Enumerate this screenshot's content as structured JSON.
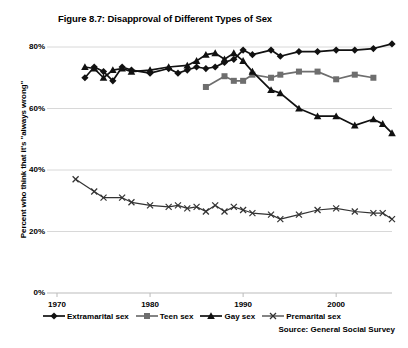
{
  "chart_data": {
    "type": "line",
    "title": "Figure 8.7: Disapproval of Different Types of Sex",
    "xlabel": "",
    "ylabel": "Percent who think that it's \"always wrong\"",
    "source": "Source: General Social Survey",
    "xlim": [
      1970,
      2006
    ],
    "ylim": [
      0,
      85
    ],
    "xticks": [
      1970,
      1980,
      1990,
      2000
    ],
    "xtick_labels": [
      "1970",
      "1980",
      "1990",
      "2000"
    ],
    "yticks": [
      0,
      20,
      40,
      60,
      80
    ],
    "ytick_labels": [
      "0%",
      "20%",
      "40%",
      "60%",
      "80%"
    ],
    "grid": "horizontal",
    "legend_position": "bottom",
    "series": [
      {
        "name": "Extramarital sex",
        "marker": "diamond",
        "color": "#111111",
        "points": [
          [
            1973,
            70.0
          ],
          [
            1974,
            73.5
          ],
          [
            1975,
            72.0
          ],
          [
            1976,
            69.0
          ],
          [
            1977,
            73.5
          ],
          [
            1978,
            72.5
          ],
          [
            1980,
            71.5
          ],
          [
            1982,
            73.0
          ],
          [
            1983,
            71.5
          ],
          [
            1984,
            72.5
          ],
          [
            1985,
            73.5
          ],
          [
            1986,
            73.0
          ],
          [
            1987,
            73.5
          ],
          [
            1988,
            75.0
          ],
          [
            1989,
            76.0
          ],
          [
            1990,
            79.0
          ],
          [
            1991,
            77.5
          ],
          [
            1993,
            79.0
          ],
          [
            1994,
            77.0
          ],
          [
            1996,
            78.5
          ],
          [
            1998,
            78.5
          ],
          [
            2000,
            79.0
          ],
          [
            2002,
            79.0
          ],
          [
            2004,
            79.5
          ],
          [
            2006,
            81.0
          ]
        ]
      },
      {
        "name": "Teen sex",
        "marker": "square",
        "color": "#6e6e6e",
        "points": [
          [
            1986,
            67.0
          ],
          [
            1988,
            70.5
          ],
          [
            1989,
            69.0
          ],
          [
            1990,
            69.0
          ],
          [
            1991,
            71.0
          ],
          [
            1993,
            70.0
          ],
          [
            1994,
            71.0
          ],
          [
            1996,
            72.0
          ],
          [
            1998,
            72.0
          ],
          [
            2000,
            69.5
          ],
          [
            2002,
            71.0
          ],
          [
            2004,
            70.0
          ]
        ]
      },
      {
        "name": "Gay sex",
        "marker": "triangle",
        "color": "#111111",
        "points": [
          [
            1973,
            73.5
          ],
          [
            1974,
            73.0
          ],
          [
            1975,
            70.0
          ],
          [
            1976,
            72.5
          ],
          [
            1977,
            73.0
          ],
          [
            1978,
            72.0
          ],
          [
            1980,
            72.5
          ],
          [
            1982,
            73.5
          ],
          [
            1984,
            74.0
          ],
          [
            1985,
            75.5
          ],
          [
            1986,
            77.5
          ],
          [
            1987,
            78.0
          ],
          [
            1988,
            76.0
          ],
          [
            1989,
            78.0
          ],
          [
            1990,
            75.5
          ],
          [
            1991,
            72.0
          ],
          [
            1993,
            66.0
          ],
          [
            1994,
            65.0
          ],
          [
            1996,
            60.0
          ],
          [
            1998,
            57.5
          ],
          [
            2000,
            57.5
          ],
          [
            2002,
            54.5
          ],
          [
            2004,
            56.5
          ],
          [
            2005,
            55.0
          ],
          [
            2006,
            52.0
          ]
        ]
      },
      {
        "name": "Premarital sex",
        "marker": "x",
        "color": "#333333",
        "points": [
          [
            1972,
            37.0
          ],
          [
            1974,
            33.0
          ],
          [
            1975,
            31.0
          ],
          [
            1977,
            31.0
          ],
          [
            1978,
            29.5
          ],
          [
            1980,
            28.5
          ],
          [
            1982,
            28.0
          ],
          [
            1983,
            28.5
          ],
          [
            1984,
            27.5
          ],
          [
            1985,
            28.0
          ],
          [
            1986,
            26.5
          ],
          [
            1987,
            28.5
          ],
          [
            1988,
            26.5
          ],
          [
            1989,
            28.0
          ],
          [
            1990,
            27.0
          ],
          [
            1991,
            26.0
          ],
          [
            1993,
            25.5
          ],
          [
            1994,
            24.0
          ],
          [
            1996,
            25.5
          ],
          [
            1998,
            27.0
          ],
          [
            2000,
            27.5
          ],
          [
            2002,
            26.5
          ],
          [
            2004,
            26.0
          ],
          [
            2005,
            26.0
          ],
          [
            2006,
            24.0
          ]
        ]
      }
    ]
  },
  "legend": {
    "items": [
      {
        "label": "Extramarital sex",
        "marker": "diamond-marker-icon"
      },
      {
        "label": "Teen sex",
        "marker": "square-marker-icon"
      },
      {
        "label": "Gay sex",
        "marker": "triangle-marker-icon"
      },
      {
        "label": "Premarital sex",
        "marker": "x-marker-icon"
      }
    ]
  },
  "colors": {
    "dark": "#111111",
    "gray": "#6e6e6e",
    "grid": "#d8d8d8",
    "axis": "#bbbbbb"
  }
}
